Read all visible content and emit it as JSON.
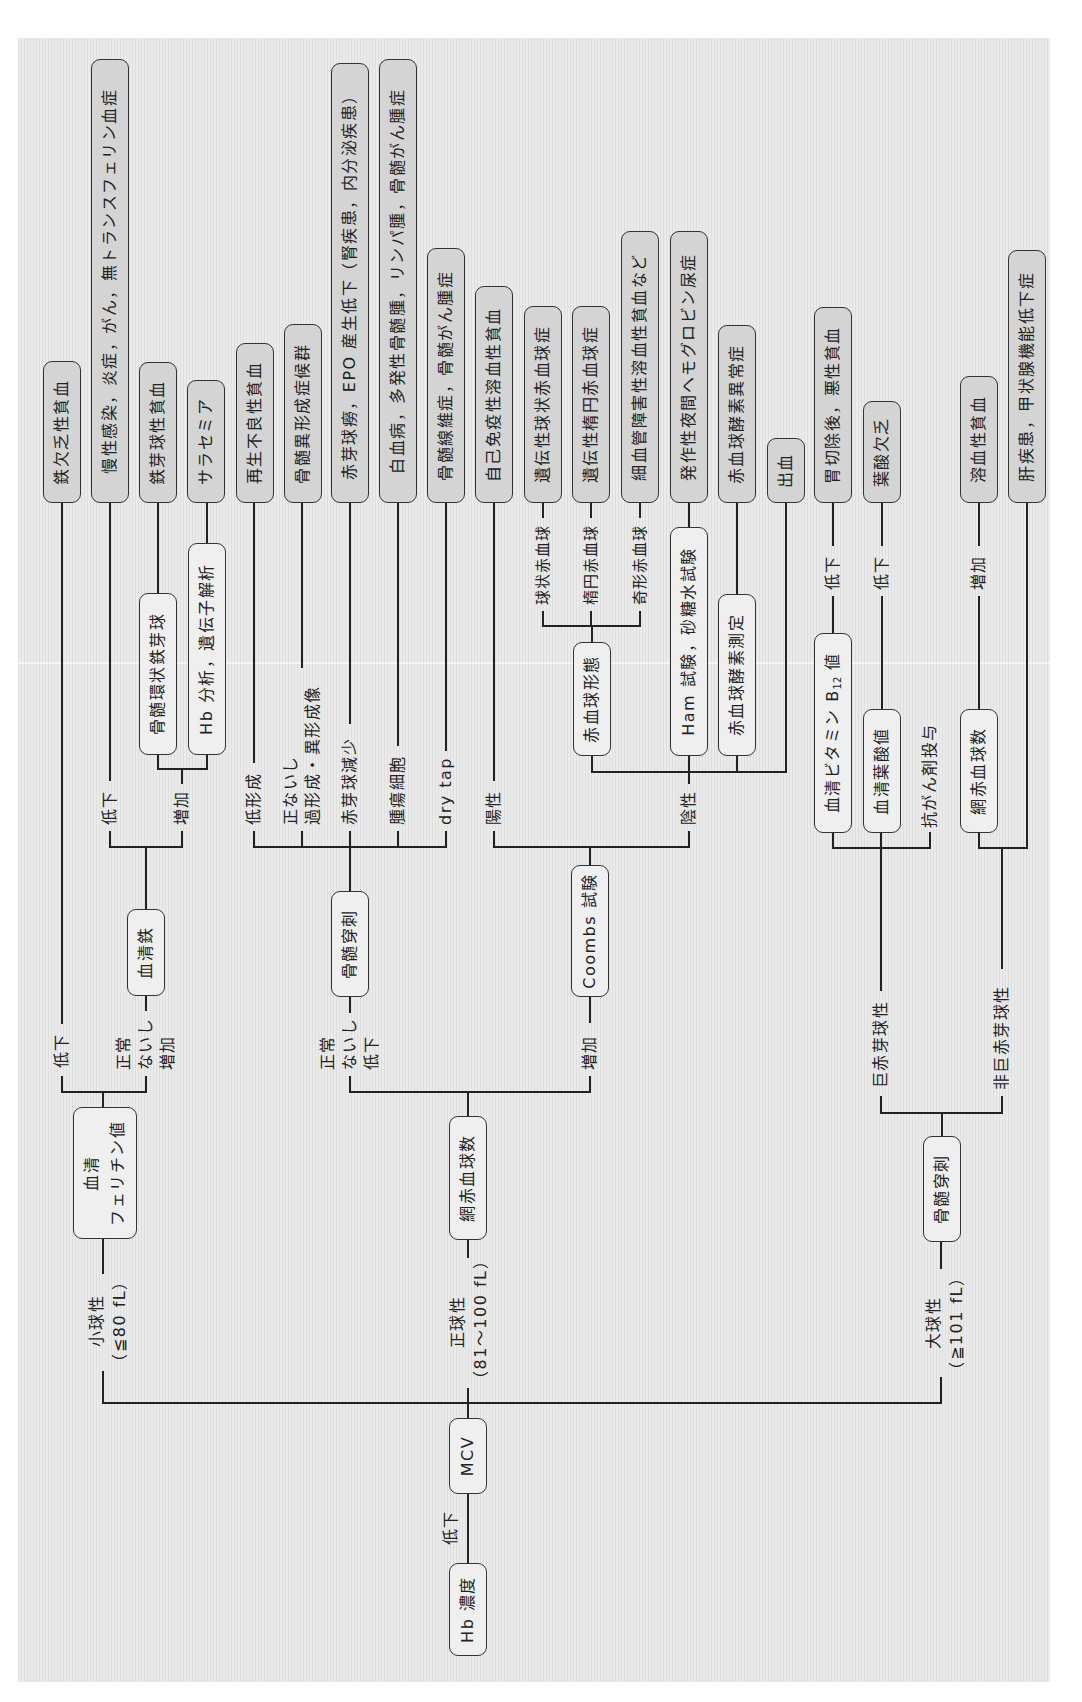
{
  "colors": {
    "page": "#ffffff",
    "panel": "#ebebeb",
    "panel_stripe": "#dedede",
    "test_box_fill": "#efefef",
    "diagnosis_box_fill": "#d4d4d4",
    "line": "#222222",
    "text": "#222222"
  },
  "diagram": {
    "root": {
      "label": "Hb 濃度",
      "edge_label": "低下"
    },
    "mcv": {
      "label": "MCV"
    },
    "microcytic": {
      "label": [
        "小球性",
        "（≦80 fL）"
      ],
      "test": [
        "血清",
        "フェリチン値"
      ],
      "low": {
        "label": "低下",
        "diagnosis": "鉄欠乏性貧血"
      },
      "normal_or_high": {
        "label": [
          "正常",
          "ないし",
          "増加"
        ],
        "test": "血清鉄",
        "low": {
          "label": "低下",
          "diagnosis": "慢性感染，炎症，がん，無トランスフェリン血症"
        },
        "high": {
          "label": "増加",
          "items": [
            {
              "test": "骨髄環状鉄芽球",
              "diagnosis": "鉄芽球性貧血"
            },
            {
              "test": "Hb 分析，遺伝子解析",
              "diagnosis": "サラセミア"
            }
          ]
        }
      }
    },
    "normocytic": {
      "label": [
        "正球性",
        "（81～100 fL）"
      ],
      "test": "網赤血球数",
      "normal_or_low": {
        "label": [
          "正常",
          "ないし",
          "低下"
        ],
        "test": "骨髄穿刺",
        "findings": [
          {
            "label": [
              "低形成"
            ],
            "diagnosis": "再生不良性貧血"
          },
          {
            "label": [
              "正ないし",
              "過形成・異形成像"
            ],
            "diagnosis": "骨髄異形成症候群"
          },
          {
            "label": [
              "赤芽球減少"
            ],
            "diagnosis": "赤芽球癆，EPO 産生低下（腎疾患，内分泌疾患）"
          },
          {
            "label": [
              "腫瘍細胞"
            ],
            "diagnosis": "白血病，多発性骨髄腫，リンパ腫，骨髄がん腫症"
          },
          {
            "label": [
              "dry tap"
            ],
            "diagnosis": "骨髄線維症，骨髄がん腫症"
          }
        ]
      },
      "high": {
        "label": "増加",
        "test": "Coombs 試験",
        "positive": {
          "label": "陽性",
          "diagnosis": "自己免疫性溶血性貧血"
        },
        "negative": {
          "label": "陰性",
          "morphology": {
            "test": "赤血球形態",
            "findings": [
              {
                "label": "球状赤血球",
                "diagnosis": "遺伝性球状赤血球症"
              },
              {
                "label": "楕円赤血球",
                "diagnosis": "遺伝性楕円赤血球症"
              },
              {
                "label": "奇形赤血球",
                "diagnosis": "細血管障害性溶血性貧血など"
              }
            ]
          },
          "ham": {
            "test": "Ham 試験，砂糖水試験",
            "diagnosis": "発作性夜間ヘモグロビン尿症"
          },
          "enzyme": {
            "test": "赤血球酵素測定",
            "diagnosis": "赤血球酵素異常症"
          },
          "bleeding": {
            "diagnosis": "出血"
          }
        }
      }
    },
    "macrocytic": {
      "label": [
        "大球性",
        "（≧101 fL）"
      ],
      "test": "骨髄穿刺",
      "megaloblastic": {
        "label": "巨赤芽球性",
        "b12": {
          "test": {
            "main": "血清ビタミン B",
            "sub": "12",
            "suffix": " 値"
          },
          "edge_label": "低下",
          "diagnosis": "胃切除後，悪性貧血"
        },
        "folate": {
          "test": "血清葉酸値",
          "edge_label": "低下",
          "diagnosis": "葉酸欠乏"
        },
        "drug": {
          "label": "抗がん剤投与"
        }
      },
      "non_megaloblastic": {
        "label": "非巨赤芽球性",
        "reticulocyte": {
          "test": "網赤血球数",
          "edge_label": "増加",
          "diagnosis": "溶血性貧血"
        },
        "other": {
          "diagnosis": "肝疾患，甲状腺機能低下症"
        }
      }
    }
  }
}
